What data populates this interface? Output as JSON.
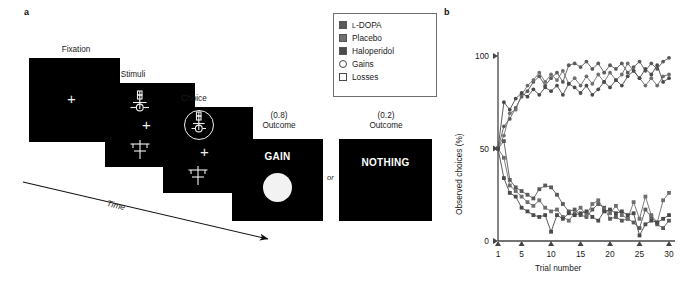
{
  "panels": {
    "a_letter": "a",
    "b_letter": "b"
  },
  "task": {
    "frames": [
      {
        "label": "Fixation",
        "content": "fixation-cross"
      },
      {
        "label": "Stimuli",
        "content": "two-symbols"
      },
      {
        "label": "Choice",
        "content": "two-symbols-with-selection-ring"
      },
      {
        "label": "Outcome",
        "prob": "(0.8)",
        "word": "GAIN",
        "content": "coin"
      },
      {
        "label": "Outcome",
        "prob": "(0.2)",
        "word": "NOTHING",
        "content": "blank"
      }
    ],
    "or_label": "or",
    "time_label": "Time"
  },
  "legend": {
    "items": [
      {
        "label": "L-DOPA",
        "small_caps_prefix": "L",
        "rest": "-DOPA",
        "marker": "filled-square",
        "color": "#5a5a5a"
      },
      {
        "label": "Placebo",
        "marker": "filled-square",
        "color": "#6e6e6e"
      },
      {
        "label": "Haloperidol",
        "marker": "filled-square",
        "color": "#4a4a4a"
      },
      {
        "label": "Gains",
        "marker": "open-circle",
        "color": "#4a4a4a"
      },
      {
        "label": "Losses",
        "marker": "open-square",
        "color": "#4a4a4a"
      }
    ]
  },
  "chart_data": {
    "type": "line",
    "title": "",
    "xlabel": "Trial number",
    "ylabel": "Observed choices (%)",
    "xlim": [
      1,
      30
    ],
    "ylim": [
      0,
      100
    ],
    "xticks": [
      1,
      5,
      10,
      15,
      20,
      25,
      30
    ],
    "yticks": [
      0,
      50,
      100
    ],
    "grid": false,
    "legend_position": "external-top-left",
    "x": [
      1,
      2,
      3,
      4,
      5,
      6,
      7,
      8,
      9,
      10,
      11,
      12,
      13,
      14,
      15,
      16,
      17,
      18,
      19,
      20,
      21,
      22,
      23,
      24,
      25,
      26,
      27,
      28,
      29,
      30
    ],
    "series": [
      {
        "name": "L-DOPA Gains",
        "marker": "circle",
        "color": "#5a5a5a",
        "values": [
          50,
          62,
          66,
          72,
          78,
          81,
          86,
          89,
          84,
          88,
          91,
          86,
          95,
          96,
          94,
          97,
          93,
          96,
          91,
          95,
          93,
          96,
          91,
          94,
          97,
          92,
          96,
          93,
          97,
          99
        ]
      },
      {
        "name": "Placebo Gains",
        "marker": "circle",
        "color": "#6e6e6e",
        "values": [
          50,
          57,
          69,
          71,
          79,
          84,
          87,
          91,
          86,
          90,
          87,
          92,
          85,
          88,
          84,
          89,
          85,
          90,
          86,
          91,
          87,
          90,
          96,
          92,
          88,
          84,
          88,
          84,
          89,
          90
        ]
      },
      {
        "name": "Haloperidol Gains",
        "marker": "circle",
        "color": "#4a4a4a",
        "values": [
          50,
          75,
          71,
          77,
          80,
          78,
          82,
          79,
          83,
          81,
          84,
          79,
          85,
          83,
          80,
          84,
          79,
          82,
          86,
          83,
          87,
          84,
          89,
          92,
          88,
          93,
          90,
          95,
          86,
          88
        ]
      },
      {
        "name": "L-DOPA Losses",
        "marker": "square",
        "color": "#5a5a5a",
        "values": [
          50,
          54,
          33,
          29,
          27,
          25,
          23,
          28,
          30,
          29,
          25,
          20,
          16,
          17,
          14,
          13,
          17,
          20,
          18,
          12,
          13,
          11,
          12,
          10,
          7,
          17,
          13,
          9,
          7,
          11
        ]
      },
      {
        "name": "Placebo Losses",
        "marker": "square",
        "color": "#6e6e6e",
        "values": [
          50,
          45,
          30,
          27,
          24,
          21,
          19,
          22,
          18,
          16,
          17,
          13,
          11,
          15,
          18,
          14,
          20,
          22,
          17,
          15,
          19,
          14,
          12,
          21,
          12,
          24,
          14,
          10,
          22,
          26
        ]
      },
      {
        "name": "Haloperidol Losses",
        "marker": "square",
        "color": "#4a4a4a",
        "values": [
          50,
          34,
          26,
          24,
          18,
          16,
          14,
          13,
          14,
          5,
          14,
          12,
          15,
          14,
          15,
          16,
          13,
          11,
          16,
          17,
          15,
          16,
          14,
          15,
          3,
          9,
          11,
          10,
          12,
          14
        ]
      }
    ]
  }
}
